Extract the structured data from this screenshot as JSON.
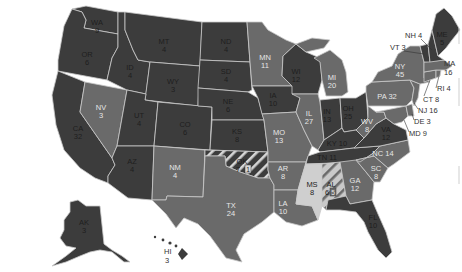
{
  "map": {
    "title": "",
    "colors": {
      "party_a": "#3c3c3c",
      "party_b": "#6a6a6a",
      "unpledged": "#cfcfcf",
      "border": "#c9c9c9",
      "background": "#ffffff"
    },
    "legend": []
  },
  "states": {
    "WA": {
      "abbr": "WA",
      "ev": "9"
    },
    "OR": {
      "abbr": "OR",
      "ev": "6"
    },
    "CA": {
      "abbr": "CA",
      "ev": "32"
    },
    "ID": {
      "abbr": "ID",
      "ev": "4"
    },
    "NV": {
      "abbr": "NV",
      "ev": "3"
    },
    "MT": {
      "abbr": "MT",
      "ev": "4"
    },
    "WY": {
      "abbr": "WY",
      "ev": "3"
    },
    "UT": {
      "abbr": "UT",
      "ev": "4"
    },
    "AZ": {
      "abbr": "AZ",
      "ev": "4"
    },
    "CO": {
      "abbr": "CO",
      "ev": "6"
    },
    "NM": {
      "abbr": "NM",
      "ev": "4"
    },
    "ND": {
      "abbr": "ND",
      "ev": "4"
    },
    "SD": {
      "abbr": "SD",
      "ev": "4"
    },
    "NE": {
      "abbr": "NE",
      "ev": "6"
    },
    "KS": {
      "abbr": "KS",
      "ev": "8"
    },
    "OK": {
      "abbr": "OK",
      "ev": "7",
      "split_ev": "1"
    },
    "TX": {
      "abbr": "TX",
      "ev": "24"
    },
    "MN": {
      "abbr": "MN",
      "ev": "11"
    },
    "IA": {
      "abbr": "IA",
      "ev": "10"
    },
    "MO": {
      "abbr": "MO",
      "ev": "13"
    },
    "AR": {
      "abbr": "AR",
      "ev": "8"
    },
    "LA": {
      "abbr": "LA",
      "ev": "10"
    },
    "WI": {
      "abbr": "WI",
      "ev": "12"
    },
    "IL": {
      "abbr": "IL",
      "ev": "27"
    },
    "MI": {
      "abbr": "MI",
      "ev": "20"
    },
    "IN": {
      "abbr": "IN",
      "ev": "13"
    },
    "OH": {
      "abbr": "OH",
      "ev": "25"
    },
    "KY": {
      "abbr": "KY",
      "ev": "10"
    },
    "TN": {
      "abbr": "TN",
      "ev": "11"
    },
    "MS": {
      "abbr": "MS",
      "ev": "8"
    },
    "AL": {
      "abbr": "AL",
      "ev": "6",
      "split_ev": "5"
    },
    "GA": {
      "abbr": "GA",
      "ev": "12"
    },
    "FL": {
      "abbr": "FL",
      "ev": "10"
    },
    "SC": {
      "abbr": "SC",
      "ev": "8"
    },
    "NC": {
      "abbr": "NC",
      "ev": "14"
    },
    "VA": {
      "abbr": "VA",
      "ev": "12"
    },
    "WV": {
      "abbr": "WV",
      "ev": "8"
    },
    "PA": {
      "abbr": "PA",
      "ev": "32"
    },
    "NY": {
      "abbr": "NY",
      "ev": "45"
    },
    "VT": {
      "abbr": "VT",
      "ev": "3"
    },
    "NH": {
      "abbr": "NH",
      "ev": "4"
    },
    "ME": {
      "abbr": "ME",
      "ev": "5"
    },
    "MA": {
      "abbr": "MA",
      "ev": "16"
    },
    "RI": {
      "abbr": "RI",
      "ev": "4"
    },
    "CT": {
      "abbr": "CT",
      "ev": "8"
    },
    "NJ": {
      "abbr": "NJ",
      "ev": "16"
    },
    "DE": {
      "abbr": "DE",
      "ev": "3"
    },
    "MD": {
      "abbr": "MD",
      "ev": "9"
    },
    "AK": {
      "abbr": "AK",
      "ev": "3"
    },
    "HI": {
      "abbr": "HI",
      "ev": "3"
    }
  },
  "outside_labels": {
    "NH": "NH 4",
    "VT": "VT 3",
    "MA": "MA",
    "MA_ev": "16",
    "RI": "RI 4",
    "CT": "CT 8",
    "NJ": "NJ 16",
    "DE": "DE 3",
    "MD": "MD 9",
    "PA": "PA 32",
    "NC": "NC 14",
    "KY": "KY 10",
    "TN": "TN 11"
  }
}
